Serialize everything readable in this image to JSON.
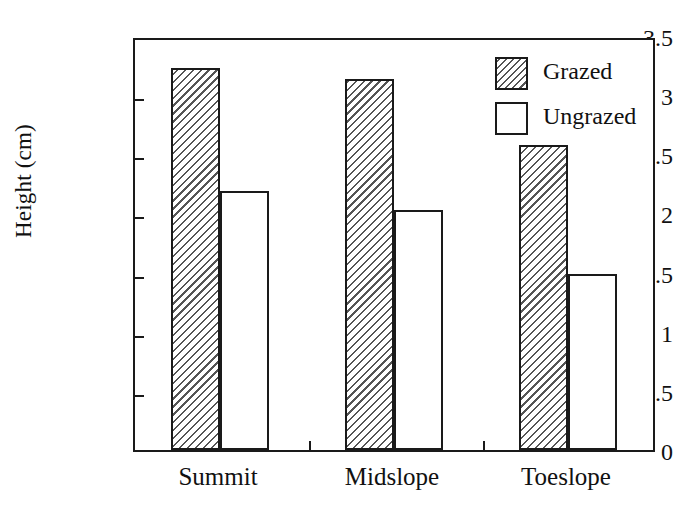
{
  "chart_data": {
    "type": "bar",
    "title": "",
    "xlabel": "",
    "ylabel": "Height (cm)",
    "categories": [
      "Summit",
      "Midslope",
      "Toeslope"
    ],
    "series": [
      {
        "name": "Grazed",
        "values": [
          3.23,
          3.14,
          2.58
        ]
      },
      {
        "name": "Ungrazed",
        "values": [
          2.19,
          2.03,
          1.49
        ]
      }
    ],
    "ylim": [
      0,
      3.5
    ],
    "y_ticks": [
      "0",
      "0.5",
      "1",
      "1.5",
      "2",
      "2.5",
      "3",
      "3.5"
    ],
    "y_tick_values": [
      0,
      0.5,
      1,
      1.5,
      2,
      2.5,
      3,
      3.5
    ],
    "grid": false,
    "legend_position": "top-right",
    "legend_entries": [
      {
        "label": "Grazed",
        "fill": "hatched"
      },
      {
        "label": "Ungrazed",
        "fill": "white"
      }
    ],
    "colors": {
      "outline": "#1a1a1a",
      "fill": "#ffffff",
      "hatch": "#555555"
    }
  }
}
